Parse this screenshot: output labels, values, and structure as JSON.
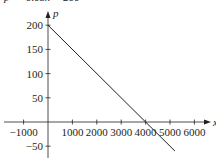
{
  "chart_data": {
    "type": "line",
    "title": "p = -0.05x + 200",
    "xlabel": "x",
    "ylabel": "p",
    "xlim": [
      -1200,
      6800
    ],
    "ylim": [
      -60,
      220
    ],
    "x_ticks": [
      -1000,
      1000,
      2000,
      3000,
      4000,
      5000,
      6000
    ],
    "x_tick_labels": [
      "−1000",
      "1000",
      "2000",
      "3000",
      "4000",
      "5000",
      "6000"
    ],
    "y_ticks": [
      -50,
      50,
      100,
      150,
      200
    ],
    "y_tick_labels": [
      "−50",
      "50",
      "100",
      "150",
      "200"
    ],
    "grid": false,
    "legend": null,
    "series": [
      {
        "name": "p = -0.05x + 200",
        "x": [
          0,
          4000,
          5200
        ],
        "y": [
          200,
          0,
          -60
        ]
      }
    ],
    "annotations": [
      "intercept p = 200 at x = 0",
      "intercept x = 4000 at p = 0"
    ]
  }
}
